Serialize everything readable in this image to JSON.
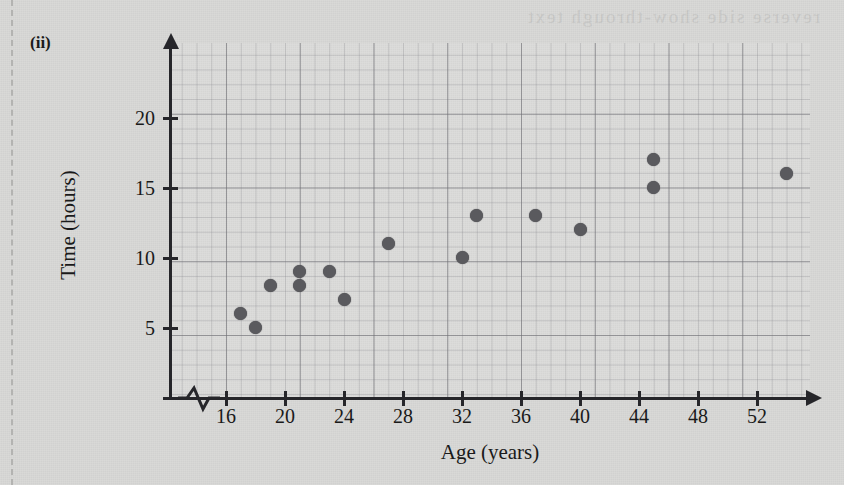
{
  "page": {
    "part_label": "(ii)",
    "bleed_text": "reverse side show-through text",
    "background_color": "#d6d6d4",
    "margin_rule_color": "#b3b3b1"
  },
  "chart_data": {
    "type": "scatter",
    "title": "",
    "xlabel": "Age (years)",
    "ylabel": "Time (hours)",
    "xlim": [
      14,
      57.4
    ],
    "ylim": [
      0,
      25.4
    ],
    "xticks": [
      16,
      20,
      24,
      28,
      32,
      36,
      40,
      44,
      48,
      52
    ],
    "yticks": [
      5,
      10,
      15,
      20
    ],
    "xtick_labels": [
      "16",
      "20",
      "24",
      "28",
      "32",
      "36",
      "40",
      "44",
      "48",
      "52"
    ],
    "ytick_labels": [
      "5",
      "10",
      "15",
      "20"
    ],
    "grid": true,
    "grid_minor_step": 1,
    "grid_major_step": 5,
    "legend": "none",
    "axis_break": "x-axis zigzag between origin and 16",
    "marker_color": "#5a5a5e",
    "axis_color": "#26262a",
    "points": [
      {
        "x": 17,
        "y": 6
      },
      {
        "x": 18,
        "y": 5
      },
      {
        "x": 19,
        "y": 8
      },
      {
        "x": 21,
        "y": 9
      },
      {
        "x": 21,
        "y": 8
      },
      {
        "x": 23,
        "y": 9
      },
      {
        "x": 24,
        "y": 7
      },
      {
        "x": 27,
        "y": 11
      },
      {
        "x": 32,
        "y": 10
      },
      {
        "x": 33,
        "y": 13
      },
      {
        "x": 37,
        "y": 13
      },
      {
        "x": 40,
        "y": 12
      },
      {
        "x": 45,
        "y": 17
      },
      {
        "x": 45,
        "y": 15
      },
      {
        "x": 54,
        "y": 16
      }
    ]
  }
}
